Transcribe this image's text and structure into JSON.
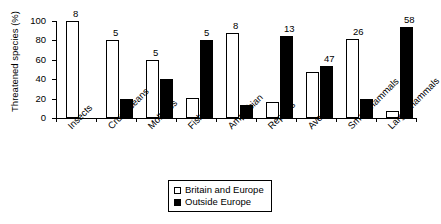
{
  "chart_data": {
    "type": "bar",
    "title": "",
    "xlabel": "",
    "ylabel": "Threatened species (%)",
    "ylim": [
      0,
      100
    ],
    "yticks": [
      0,
      20,
      40,
      60,
      80,
      100
    ],
    "grid": false,
    "legend_position": "bottom-center",
    "categories": [
      "Insects",
      "Crustaceans",
      "Molluscs",
      "Fish",
      "Amphibian",
      "Reptiles",
      "Aves",
      "Small mammals",
      "Large mammals"
    ],
    "group_labels": [
      8,
      5,
      5,
      5,
      8,
      13,
      47,
      26,
      58
    ],
    "series": [
      {
        "name": "Britain and Europe",
        "color": "#ffffff",
        "values": [
          100,
          80,
          60,
          21,
          88,
          16,
          47,
          81,
          7
        ]
      },
      {
        "name": "Outside Europe",
        "color": "#000000",
        "values": [
          0,
          20,
          40,
          80,
          13,
          85,
          54,
          20,
          94
        ]
      }
    ]
  },
  "legend": {
    "items": [
      {
        "label": "Britain and Europe",
        "swatch": "light"
      },
      {
        "label": "Outside Europe",
        "swatch": "dark"
      }
    ]
  }
}
